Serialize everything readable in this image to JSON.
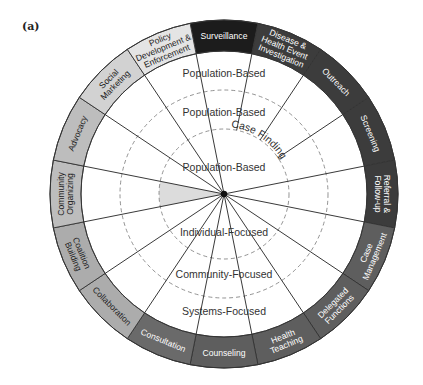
{
  "panel_label": "(a)",
  "wheel": {
    "center": [
      224,
      194
    ],
    "outer_radius": 174,
    "ring_inner_radius": 143,
    "dashed_radii": [
      65,
      104
    ],
    "segment_angle": 22.5,
    "segments": [
      {
        "label": [
          "Surveillance"
        ],
        "fill": "#1c1c1c",
        "text": "#ffffff"
      },
      {
        "label": [
          "Disease &",
          "Health Event",
          "Investigation"
        ],
        "fill": "#3c3c3c",
        "text": "#ffffff"
      },
      {
        "label": [
          "Outreach"
        ],
        "fill": "#3c3c3c",
        "text": "#ffffff"
      },
      {
        "label": [
          "Screening"
        ],
        "fill": "#3c3c3c",
        "text": "#ffffff"
      },
      {
        "label": [
          "Referral &",
          "Follow-up"
        ],
        "fill": "#3c3c3c",
        "text": "#ffffff"
      },
      {
        "label": [
          "Case",
          "Management"
        ],
        "fill": "#5e5e5e",
        "text": "#ffffff"
      },
      {
        "label": [
          "Delegated",
          "Functions"
        ],
        "fill": "#5e5e5e",
        "text": "#ffffff"
      },
      {
        "label": [
          "Health",
          "Teaching"
        ],
        "fill": "#5e5e5e",
        "text": "#ffffff"
      },
      {
        "label": [
          "Counseling"
        ],
        "fill": "#5e5e5e",
        "text": "#ffffff"
      },
      {
        "label": [
          "Consultation"
        ],
        "fill": "#6a6a6a",
        "text": "#ffffff"
      },
      {
        "label": [
          "Collaboration"
        ],
        "fill": "#acacac",
        "text": "#222222"
      },
      {
        "label": [
          "Coalition",
          "Building"
        ],
        "fill": "#acacac",
        "text": "#222222"
      },
      {
        "label": [
          "Community",
          "Organizing"
        ],
        "fill": "#bdbdbd",
        "text": "#222222"
      },
      {
        "label": [
          "Advocacy"
        ],
        "fill": "#bdbdbd",
        "text": "#222222"
      },
      {
        "label": [
          "Social",
          "Marketing"
        ],
        "fill": "#d2d2d2",
        "text": "#222222"
      },
      {
        "label": [
          "Policy",
          "Development &",
          "Enforcement"
        ],
        "fill": "#e4e4e4",
        "text": "#222222"
      }
    ],
    "short_spokes": [
      0,
      1,
      2
    ],
    "short_spoke_radius": 65,
    "shaded_wedge": {
      "segment": 12,
      "radius": 65,
      "fill": "#dcdcdc"
    },
    "inner_labels": [
      {
        "text": "Population-Based",
        "x": 224,
        "y": 77
      },
      {
        "text": "Population-Based",
        "x": 224,
        "y": 116
      },
      {
        "text": "Population-Based",
        "x": 224,
        "y": 171
      },
      {
        "text": "Individual-Focused",
        "x": 224,
        "y": 236
      },
      {
        "text": "Community-Focused",
        "x": 224,
        "y": 278
      },
      {
        "text": "Systems-Focused",
        "x": 224,
        "y": 315
      }
    ],
    "case_finding_label": "Case Finding"
  }
}
